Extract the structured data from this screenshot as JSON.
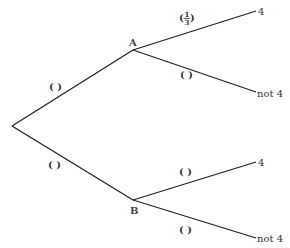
{
  "diagram": {
    "type": "probability-tree",
    "nodes": {
      "root": {
        "label": ""
      },
      "A": {
        "label": "A"
      },
      "B": {
        "label": "B"
      }
    },
    "branches": [
      {
        "from": "root",
        "to": "A",
        "probability": "( )"
      },
      {
        "from": "root",
        "to": "B",
        "probability": "( )"
      },
      {
        "from": "A",
        "to": "A-4",
        "probability_num": "1",
        "probability_den": "3",
        "outcome": "4"
      },
      {
        "from": "A",
        "to": "A-not4",
        "probability": "( )",
        "outcome": "not 4"
      },
      {
        "from": "B",
        "to": "B-4",
        "probability": "( )",
        "outcome": "4"
      },
      {
        "from": "B",
        "to": "B-not4",
        "probability": "( )",
        "outcome": "not 4"
      }
    ]
  }
}
